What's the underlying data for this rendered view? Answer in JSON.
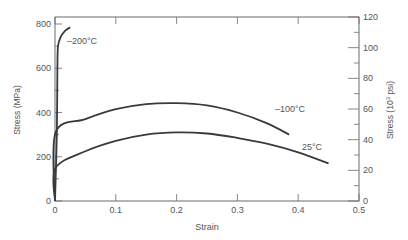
{
  "chart_data": {
    "type": "line",
    "title": "",
    "xlabel": "Strain",
    "ylabel": "Stress (MPa)",
    "y2label": "Stress (10^3 psi)",
    "xlim": [
      0,
      0.5
    ],
    "ylim": [
      0,
      800
    ],
    "y2lim": [
      0,
      120
    ],
    "x_ticks": [
      "0",
      "0.1",
      "0.2",
      "0.3",
      "0.4",
      "0.5"
    ],
    "y_ticks": [
      "0",
      "200",
      "400",
      "600",
      "800"
    ],
    "y2_ticks": [
      "0",
      "20",
      "40",
      "60",
      "80",
      "100",
      "120"
    ],
    "grid": false,
    "series": [
      {
        "name": "-200°C",
        "label": "–200°C",
        "points": [
          [
            0,
            0
          ],
          [
            0.003,
            300
          ],
          [
            0.004,
            600
          ],
          [
            0.005,
            700
          ],
          [
            0.01,
            745
          ],
          [
            0.017,
            770
          ],
          [
            0.025,
            785
          ]
        ]
      },
      {
        "name": "-100°C",
        "label": "–100°C",
        "points": [
          [
            0,
            0
          ],
          [
            0.001,
            310
          ],
          [
            0.05,
            370
          ],
          [
            0.1,
            415
          ],
          [
            0.15,
            438
          ],
          [
            0.2,
            442
          ],
          [
            0.25,
            432
          ],
          [
            0.3,
            400
          ],
          [
            0.35,
            350
          ],
          [
            0.385,
            300
          ]
        ]
      },
      {
        "name": "25°C",
        "label": "25°C",
        "points": [
          [
            0,
            0
          ],
          [
            0.001,
            150
          ],
          [
            0.05,
            225
          ],
          [
            0.1,
            272
          ],
          [
            0.15,
            300
          ],
          [
            0.2,
            310
          ],
          [
            0.25,
            305
          ],
          [
            0.3,
            285
          ],
          [
            0.35,
            258
          ],
          [
            0.4,
            220
          ],
          [
            0.45,
            170
          ]
        ]
      }
    ]
  }
}
